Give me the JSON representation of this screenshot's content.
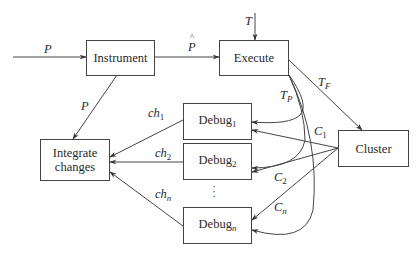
{
  "diagram": {
    "nodes": {
      "instrument": {
        "label": "Instrument"
      },
      "execute": {
        "label": "Execute"
      },
      "debug1": {
        "label": "Debug",
        "sub": "1"
      },
      "debug2": {
        "label": "Debug",
        "sub": "2"
      },
      "debugn": {
        "label": "Debug",
        "sub": "n"
      },
      "integrate": {
        "label1": "Integrate",
        "label2": "changes"
      },
      "cluster": {
        "label": "Cluster"
      }
    },
    "edges": {
      "p_in": {
        "label": "P"
      },
      "p_hat": {
        "label": "P",
        "accent": "^"
      },
      "p_down": {
        "label": "P"
      },
      "t_in": {
        "label": "T"
      },
      "t_f": {
        "label": "T",
        "sub": "F"
      },
      "t_p": {
        "label": "T",
        "sub": "P"
      },
      "ch1": {
        "label": "ch",
        "sub": "1"
      },
      "ch2": {
        "label": "ch",
        "sub": "2"
      },
      "chn": {
        "label": "ch",
        "sub": "n"
      },
      "c1": {
        "label": "C",
        "sub": "1"
      },
      "c2": {
        "label": "C",
        "sub": "2"
      },
      "cn": {
        "label": "C",
        "sub": "n"
      }
    },
    "ellipsis": "⋮"
  }
}
